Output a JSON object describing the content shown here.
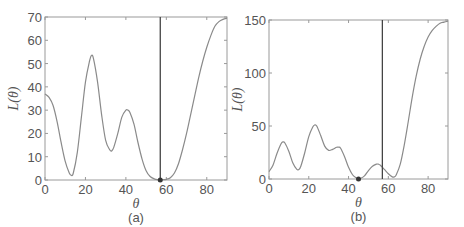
{
  "chart_data": [
    {
      "type": "line",
      "caption": "(a)",
      "xlabel": "θ",
      "ylabel": "L(θ)",
      "xlim": [
        0,
        90
      ],
      "ylim": [
        0,
        70
      ],
      "xticks": [
        0,
        20,
        40,
        60,
        80
      ],
      "yticks": [
        0,
        10,
        20,
        30,
        40,
        50,
        60,
        70
      ],
      "grid": false,
      "series": [
        {
          "name": "L(θ)",
          "color": "#8a8a8a",
          "x": [
            0,
            2,
            4,
            6,
            8,
            10,
            12,
            13,
            14,
            16,
            18,
            20,
            22,
            23,
            24,
            26,
            28,
            30,
            32,
            33,
            34,
            36,
            38,
            40,
            41,
            42,
            44,
            46,
            48,
            50,
            52,
            54,
            56,
            57,
            58,
            60,
            62,
            64,
            66,
            68,
            70,
            72,
            74,
            76,
            78,
            80,
            82,
            84,
            86,
            88,
            90
          ],
          "y": [
            37,
            35.5,
            32,
            25,
            16,
            8,
            3,
            2,
            3,
            12,
            27,
            42,
            51,
            53.5,
            52,
            42,
            28,
            17,
            13,
            12.5,
            14,
            20,
            27,
            30,
            30,
            29,
            24,
            16,
            9,
            4,
            1.5,
            0.5,
            0.1,
            0,
            0.1,
            0.3,
            1,
            3,
            7,
            13,
            20,
            28,
            36,
            44,
            51,
            57,
            62,
            66,
            68,
            69,
            69.5
          ]
        }
      ],
      "vertical_line_x": 57,
      "marker": {
        "x": 57,
        "y": 0
      }
    },
    {
      "type": "line",
      "caption": "(b)",
      "xlabel": "θ",
      "ylabel": "L(θ)",
      "xlim": [
        0,
        90
      ],
      "ylim": [
        0,
        150
      ],
      "xticks": [
        0,
        20,
        40,
        60,
        80
      ],
      "yticks": [
        0,
        50,
        100,
        150
      ],
      "grid": false,
      "series": [
        {
          "name": "L(θ)",
          "color": "#8a8a8a",
          "x": [
            0,
            2,
            4,
            6,
            7,
            8,
            10,
            12,
            14,
            15,
            16,
            18,
            20,
            22,
            23,
            24,
            26,
            28,
            30,
            32,
            34,
            35,
            36,
            38,
            40,
            42,
            44,
            45,
            46,
            48,
            50,
            52,
            54,
            55,
            56,
            58,
            60,
            62,
            63,
            64,
            66,
            68,
            70,
            72,
            74,
            76,
            78,
            80,
            82,
            84,
            86,
            88,
            90
          ],
          "y": [
            7,
            13,
            24,
            33,
            35,
            34,
            26,
            15,
            9,
            9,
            12,
            25,
            40,
            49,
            51,
            50,
            41,
            31,
            27,
            28,
            30,
            30,
            29,
            21,
            11,
            4,
            1,
            0,
            0.5,
            3,
            8,
            12,
            14,
            14,
            13,
            9,
            5,
            2,
            2,
            4,
            14,
            32,
            54,
            77,
            97,
            113,
            125,
            134,
            140,
            144,
            147,
            148,
            149
          ]
        }
      ],
      "vertical_line_x": 57,
      "marker": {
        "x": 45,
        "y": 0
      }
    }
  ]
}
